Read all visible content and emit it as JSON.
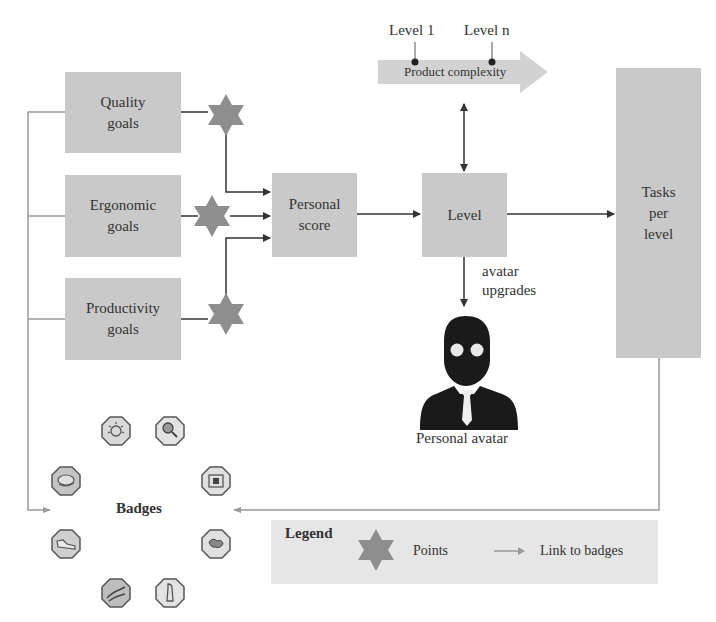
{
  "complexity": {
    "level_start_label": "Level 1",
    "level_end_label": "Level n",
    "arrow_label": "Product complexity"
  },
  "goals": [
    {
      "line1": "Quality",
      "line2": "goals"
    },
    {
      "line1": "Ergonomic",
      "line2": "goals"
    },
    {
      "line1": "Productivity",
      "line2": "goals"
    }
  ],
  "personal_score": {
    "line1": "Personal",
    "line2": "score"
  },
  "level": {
    "label": "Level"
  },
  "tasks": {
    "line1": "Tasks",
    "line2": "per",
    "line3": "level"
  },
  "avatar_upgrades": {
    "line1": "avatar",
    "line2": "upgrades"
  },
  "avatar": {
    "label": "Personal avatar",
    "icon": "person-avatar-icon"
  },
  "badges": {
    "title": "Badges",
    "icons": [
      "sun-badge-icon",
      "magnifier-badge-icon",
      "cloud-badge-icon",
      "frame-badge-icon",
      "shoe-badge-icon",
      "globe-badge-icon",
      "hand-badge-icon",
      "figure-badge-icon"
    ]
  },
  "legend": {
    "title": "Legend",
    "points_label": "Points",
    "link_label": "Link to badges"
  },
  "colors": {
    "box_fill": "#c9c9c9",
    "star_fill": "#8e8e8e",
    "line_dark": "#3a3a3a",
    "line_light": "#9a9a9a",
    "legend_fill": "#e6e6e6"
  }
}
